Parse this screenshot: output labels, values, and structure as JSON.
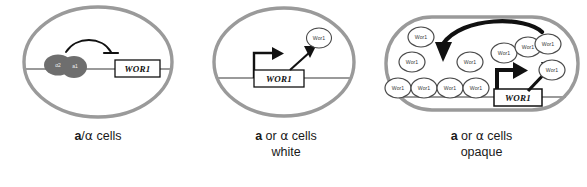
{
  "figure": {
    "gene_name": "WOR1",
    "protein_name": "Wor1",
    "colors": {
      "cell_outline": "#9a9a9a",
      "dna_line": "#9a9a9a",
      "complex_fill": "#6e6e6e",
      "arrow_black": "#111111",
      "protein_outline": "#4a4a4a",
      "text": "#1a1a1a"
    }
  },
  "panels": [
    {
      "id": "diploid",
      "cell_shape": "circle",
      "caption_line1_parts": {
        "mating_a": "a",
        "separator": "/",
        "mating_alpha": "α",
        "suffix": " cells"
      },
      "caption_line2": "",
      "gene_label": "WOR1",
      "regulation": "repression",
      "complex_subunits": [
        "α2",
        "a1"
      ],
      "proteins": []
    },
    {
      "id": "white",
      "cell_shape": "circle",
      "caption_line1_parts": {
        "mating_a": "a",
        "separator": " or ",
        "mating_alpha": "α",
        "suffix": " cells"
      },
      "caption_line2": "white",
      "gene_label": "WOR1",
      "regulation": "low-expression",
      "complex_subunits": [],
      "proteins": [
        {
          "label": "Wor1",
          "x": 123,
          "y": 38,
          "rx": 12,
          "ry": 9.5
        }
      ]
    },
    {
      "id": "opaque",
      "cell_shape": "ellipse-wide",
      "caption_line1_parts": {
        "mating_a": "a",
        "separator": " or ",
        "mating_alpha": "α",
        "suffix": " cells"
      },
      "caption_line2": "opaque",
      "gene_label": "WOR1",
      "regulation": "positive-feedback",
      "complex_subunits": [],
      "proteins": [
        {
          "label": "Wor1",
          "x": 45,
          "y": 37,
          "rx": 13,
          "ry": 10
        },
        {
          "label": "Wor1",
          "x": 36,
          "y": 62,
          "rx": 13,
          "ry": 10
        },
        {
          "label": "Wor1",
          "x": 22,
          "y": 88,
          "rx": 13,
          "ry": 10
        },
        {
          "label": "Wor1",
          "x": 48,
          "y": 88,
          "rx": 13,
          "ry": 10
        },
        {
          "label": "Wor1",
          "x": 74,
          "y": 88,
          "rx": 13,
          "ry": 10
        },
        {
          "label": "Wor1",
          "x": 100,
          "y": 88,
          "rx": 13,
          "ry": 10
        },
        {
          "label": "Wor1",
          "x": 94,
          "y": 62,
          "rx": 13,
          "ry": 10
        },
        {
          "label": "Wor1",
          "x": 128,
          "y": 53,
          "rx": 13,
          "ry": 10
        },
        {
          "label": "Wor1",
          "x": 152,
          "y": 47,
          "rx": 13,
          "ry": 10
        },
        {
          "label": "Wor1",
          "x": 172,
          "y": 44,
          "rx": 13,
          "ry": 10
        },
        {
          "label": "Wor1",
          "x": 176,
          "y": 70,
          "rx": 13,
          "ry": 10
        }
      ]
    }
  ]
}
